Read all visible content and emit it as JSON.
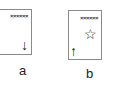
{
  "panels": [
    {
      "id": "a",
      "label": "a",
      "marker_row": "××××××",
      "arrow": "↓",
      "arrow_direction": "down"
    },
    {
      "id": "b",
      "label": "b",
      "marker_row": "××××××",
      "arrow": "↑",
      "arrow_direction": "up",
      "star": "☆"
    }
  ]
}
